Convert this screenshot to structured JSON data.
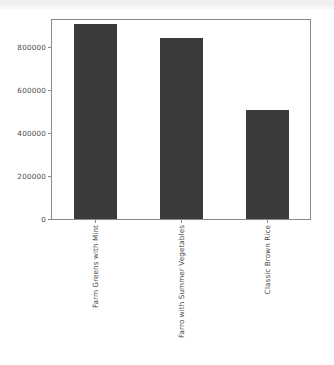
{
  "chart_data": {
    "type": "bar",
    "title": "",
    "subtitle": "",
    "xlabel": "",
    "ylabel": "",
    "categories": [
      "Farm Greens with Mint",
      "Farro with Summer Vegetables",
      "Classic Brown Rice"
    ],
    "values": [
      910000,
      845000,
      510000
    ],
    "ylim": [
      0,
      928000
    ],
    "yticks": [
      0,
      200000,
      400000,
      600000,
      800000
    ],
    "ytick_labels": [
      "0",
      "200000",
      "400000",
      "600000",
      "800000"
    ],
    "grid": false,
    "legend": false,
    "legend_position": "none",
    "bar_color": "#3b3b3b",
    "frame_color": "#8a8a8a",
    "background_color": "#ffffff",
    "tick_label_color": "#4a4a4a",
    "xtick_label_rotation": -90
  },
  "figure": {
    "name": "bar-chart-figure"
  }
}
